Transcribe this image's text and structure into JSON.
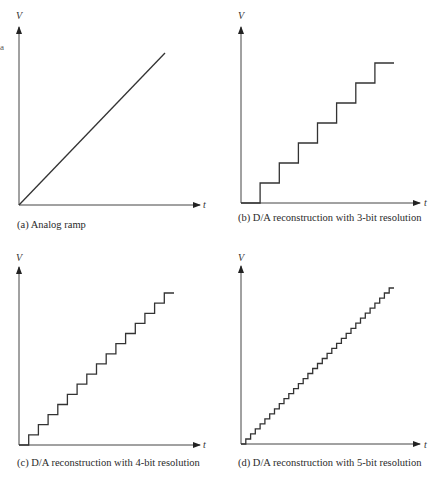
{
  "margin_mark": "a",
  "panels": [
    {
      "id": "a",
      "caption": "(a) Analog ramp",
      "y_label": "V",
      "x_label": "t",
      "type": "ramp"
    },
    {
      "id": "b",
      "caption": "(b) D/A reconstruction with 3-bit resolution",
      "y_label": "V",
      "x_label": "t",
      "type": "staircase",
      "bits": 3,
      "levels": 8
    },
    {
      "id": "c",
      "caption": "(c) D/A reconstruction with 4-bit resolution",
      "y_label": "V",
      "x_label": "t",
      "type": "staircase",
      "bits": 4,
      "levels": 16
    },
    {
      "id": "d",
      "caption": "(d) D/A reconstruction with 5-bit resolution",
      "y_label": "V",
      "x_label": "t",
      "type": "staircase",
      "bits": 5,
      "levels": 32
    }
  ],
  "colors": {
    "axis": "#333333",
    "signal": "#3a3a3a",
    "background": "#ffffff"
  }
}
